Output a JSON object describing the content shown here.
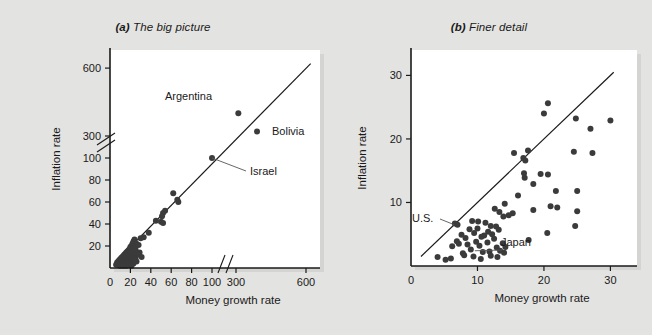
{
  "figure": {
    "background_color": "#e3e3e1",
    "plot_background_color": "#ffffff",
    "dot_color": "#3b3b3b",
    "axis_color": "#1a1a1a"
  },
  "panels": [
    {
      "key": "a",
      "tag": "(a)",
      "title": "The big picture",
      "full_title": "(a) The big picture"
    },
    {
      "key": "b",
      "tag": "(b)",
      "title": "Finer detail",
      "full_title": "(b) Finer detail"
    }
  ],
  "chart_data": [
    {
      "type": "scatter",
      "panel": "a",
      "title": "(a) The big picture",
      "xlabel": "Money growth rate",
      "ylabel": "Inflation rate",
      "xticks": [
        0,
        20,
        40,
        60,
        80,
        100,
        300,
        600
      ],
      "xtick_labels": [
        "0",
        "20",
        "40",
        "60",
        "80",
        "100",
        "300",
        "600"
      ],
      "yticks": [
        20,
        40,
        60,
        80,
        100,
        300,
        600
      ],
      "ytick_labels": [
        "20",
        "40",
        "60",
        "80",
        "100",
        "300",
        "600"
      ],
      "xlim": [
        0,
        660
      ],
      "ylim": [
        0,
        680
      ],
      "x_axis_break": true,
      "y_axis_break": true,
      "x_break_between": [
        100,
        300
      ],
      "y_break_between": [
        100,
        300
      ],
      "grid": false,
      "legend": "none",
      "reference_line": {
        "label": "45-degree line",
        "from": [
          5,
          5
        ],
        "to": [
          620,
          620
        ]
      },
      "annotations": [
        {
          "label": "Argentina",
          "x": 310,
          "y": 400,
          "leader": false
        },
        {
          "label": "Bolivia",
          "x": 390,
          "y": 320,
          "leader": false
        },
        {
          "label": "Israel",
          "x": 100,
          "y": 100,
          "leader": true
        }
      ],
      "points": [
        [
          310,
          400
        ],
        [
          390,
          320
        ],
        [
          100,
          100
        ],
        [
          62,
          68
        ],
        [
          66,
          62
        ],
        [
          67,
          60
        ],
        [
          54,
          52
        ],
        [
          52,
          50
        ],
        [
          51,
          47
        ],
        [
          45,
          43
        ],
        [
          50,
          42
        ],
        [
          52,
          41
        ],
        [
          38,
          32
        ],
        [
          33,
          28
        ],
        [
          30,
          27
        ],
        [
          24,
          26
        ],
        [
          23,
          24
        ],
        [
          22,
          22
        ],
        [
          26,
          22
        ],
        [
          28,
          21
        ],
        [
          21,
          20
        ],
        [
          20,
          19
        ],
        [
          23,
          18
        ],
        [
          25,
          17
        ],
        [
          19,
          17
        ],
        [
          18,
          16
        ],
        [
          22,
          16
        ],
        [
          17,
          15
        ],
        [
          24,
          15
        ],
        [
          20,
          14
        ],
        [
          16,
          14
        ],
        [
          29,
          14
        ],
        [
          21,
          13
        ],
        [
          15,
          13
        ],
        [
          19,
          12
        ],
        [
          27,
          12
        ],
        [
          14,
          12
        ],
        [
          23,
          11
        ],
        [
          18,
          11
        ],
        [
          13,
          11
        ],
        [
          31,
          10
        ],
        [
          16,
          10
        ],
        [
          20,
          10
        ],
        [
          12,
          10
        ],
        [
          25,
          9
        ],
        [
          15,
          9
        ],
        [
          11,
          9
        ],
        [
          21,
          9
        ],
        [
          17,
          8
        ],
        [
          13,
          8
        ],
        [
          10,
          8
        ],
        [
          24,
          8
        ],
        [
          19,
          7
        ],
        [
          14,
          7
        ],
        [
          9,
          7
        ],
        [
          22,
          7
        ],
        [
          16,
          6
        ],
        [
          12,
          6
        ],
        [
          8,
          6
        ],
        [
          26,
          6
        ],
        [
          18,
          5
        ],
        [
          13,
          5
        ],
        [
          10,
          5
        ],
        [
          7,
          5
        ],
        [
          20,
          5
        ],
        [
          15,
          4
        ],
        [
          11,
          4
        ],
        [
          9,
          4
        ],
        [
          23,
          4
        ],
        [
          17,
          4
        ],
        [
          12,
          3
        ],
        [
          8,
          3
        ],
        [
          6,
          3
        ],
        [
          19,
          3
        ],
        [
          14,
          3
        ],
        [
          10,
          2
        ],
        [
          16,
          2
        ],
        [
          21,
          2
        ],
        [
          13,
          2
        ]
      ]
    },
    {
      "type": "scatter",
      "panel": "b",
      "title": "(b) Finer detail",
      "xlabel": "Money growth rate",
      "ylabel": "Inflation rate",
      "xticks": [
        0,
        10,
        20,
        30
      ],
      "xtick_labels": [
        "0",
        "10",
        "20",
        "30"
      ],
      "yticks": [
        10,
        20,
        30
      ],
      "ytick_labels": [
        "10",
        "20",
        "30"
      ],
      "xlim": [
        0,
        34
      ],
      "ylim": [
        0,
        34
      ],
      "x_axis_break": false,
      "y_axis_break": false,
      "grid": false,
      "legend": "none",
      "reference_line": {
        "label": "45-degree line",
        "from": [
          1.5,
          1.5
        ],
        "to": [
          30.5,
          30.5
        ]
      },
      "annotations": [
        {
          "label": "U.S.",
          "x": 6.5,
          "y": 6.5,
          "leader": true
        },
        {
          "label": "Japan",
          "x": 9.6,
          "y": 2.4,
          "leader": true
        }
      ],
      "points": [
        [
          20.6,
          25.6
        ],
        [
          20.0,
          24.0
        ],
        [
          24.8,
          23.2
        ],
        [
          30.0,
          22.9
        ],
        [
          27.0,
          21.6
        ],
        [
          24.5,
          18.0
        ],
        [
          27.3,
          17.8
        ],
        [
          17.6,
          18.2
        ],
        [
          15.5,
          17.8
        ],
        [
          16.9,
          17.0
        ],
        [
          17.2,
          16.6
        ],
        [
          17.0,
          14.6
        ],
        [
          19.5,
          14.5
        ],
        [
          20.6,
          14.4
        ],
        [
          17.1,
          13.9
        ],
        [
          18.4,
          12.9
        ],
        [
          21.8,
          11.8
        ],
        [
          25.0,
          11.8
        ],
        [
          16.1,
          11.1
        ],
        [
          14.1,
          9.8
        ],
        [
          21.0,
          9.4
        ],
        [
          22.0,
          9.2
        ],
        [
          18.4,
          8.8
        ],
        [
          25.0,
          8.6
        ],
        [
          12.6,
          9.0
        ],
        [
          13.3,
          8.5
        ],
        [
          15.3,
          8.3
        ],
        [
          14.7,
          8.0
        ],
        [
          13.9,
          7.8
        ],
        [
          24.7,
          6.3
        ],
        [
          9.2,
          7.1
        ],
        [
          10.1,
          7.0
        ],
        [
          11.2,
          6.8
        ],
        [
          6.6,
          6.7
        ],
        [
          7.0,
          6.5
        ],
        [
          12.0,
          6.3
        ],
        [
          12.8,
          6.2
        ],
        [
          10.0,
          5.9
        ],
        [
          8.8,
          5.8
        ],
        [
          13.2,
          5.7
        ],
        [
          11.6,
          5.4
        ],
        [
          9.5,
          5.2
        ],
        [
          20.5,
          5.2
        ],
        [
          12.2,
          5.0
        ],
        [
          7.6,
          4.9
        ],
        [
          11.0,
          4.8
        ],
        [
          10.6,
          4.6
        ],
        [
          8.2,
          4.4
        ],
        [
          12.5,
          4.3
        ],
        [
          17.7,
          4.1
        ],
        [
          6.9,
          3.9
        ],
        [
          9.8,
          3.8
        ],
        [
          11.5,
          3.7
        ],
        [
          7.2,
          3.5
        ],
        [
          13.8,
          3.6
        ],
        [
          8.5,
          3.4
        ],
        [
          10.3,
          3.2
        ],
        [
          6.2,
          3.1
        ],
        [
          14.2,
          3.0
        ],
        [
          12.9,
          2.9
        ],
        [
          9.0,
          2.6
        ],
        [
          13.4,
          2.4
        ],
        [
          11.8,
          2.3
        ],
        [
          10.8,
          2.2
        ],
        [
          7.8,
          2.0
        ],
        [
          14.0,
          2.1
        ],
        [
          8.0,
          1.7
        ],
        [
          12.0,
          1.6
        ],
        [
          4.0,
          1.4
        ],
        [
          9.4,
          1.5
        ],
        [
          13.0,
          1.4
        ],
        [
          6.0,
          1.2
        ],
        [
          10.5,
          1.1
        ],
        [
          5.2,
          1.0
        ]
      ]
    }
  ]
}
